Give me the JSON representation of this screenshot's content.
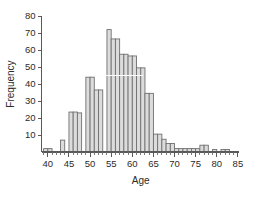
{
  "chart_data": {
    "type": "bar",
    "title": "",
    "subtitle": "",
    "xlabel": "Age",
    "ylabel": "Frequency",
    "xlim": [
      38.5,
      85.5
    ],
    "ylim": [
      0,
      80
    ],
    "grid": false,
    "legend": null,
    "bin_width": 1,
    "bar_fill": "#dcdcdc",
    "bar_edge": "#707070",
    "axis_color": "#595959",
    "background": "#ffffff",
    "x_ticks_major": [
      40,
      45,
      50,
      55,
      60,
      65,
      70,
      75,
      80,
      85
    ],
    "x_tick_labels": [
      "40",
      "45",
      "50",
      "55",
      "60",
      "65",
      "70",
      "75",
      "80",
      "85"
    ],
    "x_ticks_minor": [
      39,
      41,
      42,
      43,
      44,
      46,
      47,
      48,
      49,
      51,
      52,
      53,
      54,
      56,
      57,
      58,
      59,
      61,
      62,
      63,
      64,
      66,
      67,
      68,
      69,
      71,
      72,
      73,
      74,
      76,
      77,
      78,
      79,
      81,
      82,
      83,
      84
    ],
    "y_ticks": [
      10,
      20,
      30,
      40,
      50,
      60,
      70,
      80
    ],
    "y_tick_labels": [
      "10",
      "20",
      "30",
      "40",
      "50",
      "60",
      "70",
      "80"
    ],
    "categories": [
      39,
      40,
      41,
      42,
      43,
      44,
      45,
      46,
      47,
      48,
      49,
      50,
      51,
      52,
      53,
      54,
      55,
      56,
      57,
      58,
      59,
      60,
      61,
      62,
      63,
      64,
      65,
      66,
      67,
      68,
      69,
      70,
      71,
      72,
      73,
      74,
      75,
      76,
      77,
      78,
      79,
      80,
      81,
      82,
      83
    ],
    "values": [
      2,
      2,
      0,
      0,
      0,
      7,
      0,
      23.5,
      23,
      0,
      44,
      36.5,
      0,
      0,
      72,
      66.5,
      0,
      57.5,
      56.5,
      0,
      49.5,
      0,
      0,
      34.5,
      0,
      10.5,
      7.5,
      0,
      5,
      0,
      2,
      2,
      0,
      2,
      0,
      0,
      0,
      4,
      0,
      0,
      1.5,
      0,
      0,
      0,
      0
    ]
  },
  "bars": [
    {
      "x0": 39,
      "x1": 40,
      "height": 2
    },
    {
      "x0": 40,
      "x1": 41,
      "height": 2
    },
    {
      "x0": 43,
      "x1": 44,
      "height": 7
    },
    {
      "x0": 45,
      "x1": 46,
      "height": 23.5
    },
    {
      "x0": 46,
      "x1": 47,
      "height": 23.5
    },
    {
      "x0": 47,
      "x1": 48,
      "height": 23
    },
    {
      "x0": 49,
      "x1": 50,
      "height": 44
    },
    {
      "x0": 50,
      "x1": 51,
      "height": 44
    },
    {
      "x0": 51,
      "x1": 52,
      "height": 36.5
    },
    {
      "x0": 52,
      "x1": 53,
      "height": 36.5
    },
    {
      "x0": 54,
      "x1": 55,
      "height": 72
    },
    {
      "x0": 55,
      "x1": 56,
      "height": 66.5
    },
    {
      "x0": 56,
      "x1": 57,
      "height": 66.5
    },
    {
      "x0": 57,
      "x1": 58,
      "height": 57.5
    },
    {
      "x0": 58,
      "x1": 59,
      "height": 57.5
    },
    {
      "x0": 59,
      "x1": 60,
      "height": 56.5
    },
    {
      "x0": 60,
      "x1": 61,
      "height": 56.5
    },
    {
      "x0": 61,
      "x1": 62,
      "height": 49.5
    },
    {
      "x0": 62,
      "x1": 63,
      "height": 49.5
    },
    {
      "x0": 63,
      "x1": 64,
      "height": 34.5
    },
    {
      "x0": 64,
      "x1": 65,
      "height": 34.5
    },
    {
      "x0": 65,
      "x1": 66,
      "height": 10.5
    },
    {
      "x0": 66,
      "x1": 67,
      "height": 10.5
    },
    {
      "x0": 67,
      "x1": 68,
      "height": 7.5
    },
    {
      "x0": 68,
      "x1": 69,
      "height": 5
    },
    {
      "x0": 69,
      "x1": 70,
      "height": 5
    },
    {
      "x0": 70,
      "x1": 71,
      "height": 2
    },
    {
      "x0": 71,
      "x1": 72,
      "height": 2
    },
    {
      "x0": 72,
      "x1": 73,
      "height": 2
    },
    {
      "x0": 73,
      "x1": 74,
      "height": 2
    },
    {
      "x0": 74,
      "x1": 75,
      "height": 2
    },
    {
      "x0": 75,
      "x1": 76,
      "height": 2
    },
    {
      "x0": 76,
      "x1": 77,
      "height": 4
    },
    {
      "x0": 77,
      "x1": 78,
      "height": 4
    },
    {
      "x0": 79,
      "x1": 80,
      "height": 1.5
    },
    {
      "x0": 81,
      "x1": 82,
      "height": 1.5
    },
    {
      "x0": 82,
      "x1": 83,
      "height": 1.5
    }
  ]
}
